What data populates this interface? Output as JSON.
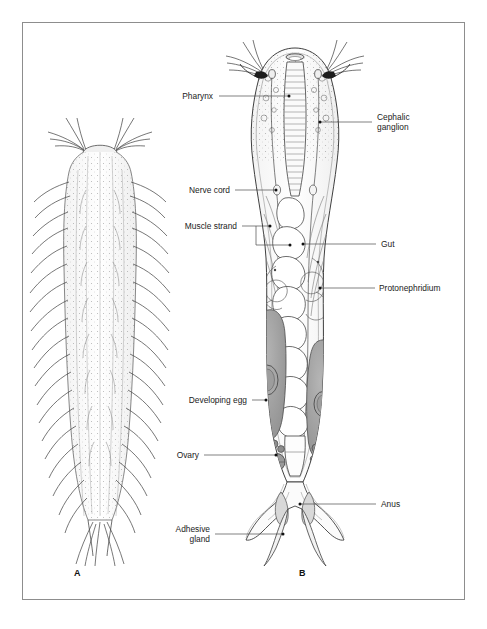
{
  "figure": {
    "border_color": "#8d8d8d",
    "background": "#ffffff",
    "ink_color": "#1b1b1b",
    "organ_fill": "#9a9a9a",
    "captions": [
      {
        "id": "caption-a",
        "text": "A"
      },
      {
        "id": "caption-b",
        "text": "B"
      }
    ],
    "panels": [
      {
        "id": "panel-a",
        "caption": "A",
        "description": "external whole-mount view of bristled rotifer body"
      },
      {
        "id": "panel-b",
        "caption": "B",
        "description": "internal anatomy of rotifer, sagittal/dorsal cutaway"
      }
    ]
  },
  "labels": {
    "left": [
      {
        "key": "pharynx",
        "text": "Pharynx"
      },
      {
        "key": "nerve-cord",
        "text": "Nerve cord"
      },
      {
        "key": "muscle-strand",
        "text": "Muscle strand"
      },
      {
        "key": "developing-egg",
        "text": "Developing egg"
      },
      {
        "key": "ovary",
        "text": "Ovary"
      },
      {
        "key": "adhesive-gland",
        "text": "Adhesive\ngland"
      }
    ],
    "right": [
      {
        "key": "cephalic-ganglion",
        "text": "Cephalic\nganglion"
      },
      {
        "key": "gut",
        "text": "Gut"
      },
      {
        "key": "protonephridium",
        "text": "Protonephridium"
      },
      {
        "key": "anus",
        "text": "Anus"
      }
    ]
  }
}
